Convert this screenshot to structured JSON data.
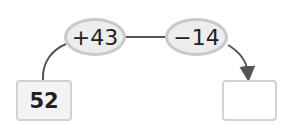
{
  "start": {
    "value": "52"
  },
  "operations": [
    {
      "label": "+43"
    },
    {
      "label": "−14"
    }
  ],
  "result": {
    "value": ""
  },
  "colors": {
    "line": "#555555",
    "oval_fill": "#ededed",
    "oval_border": "#c9c9c9",
    "box_border": "#d2d2d2"
  }
}
